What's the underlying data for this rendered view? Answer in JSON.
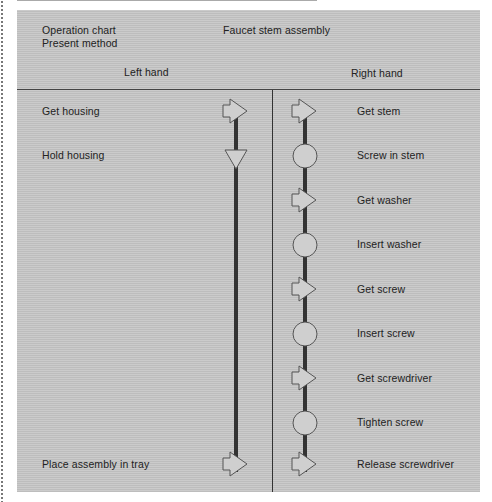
{
  "header": {
    "title_line1": "Operation chart",
    "title_line2": "Present method",
    "subject": "Faucet stem assembly",
    "left_column": "Left hand",
    "right_column": "Right hand"
  },
  "left_hand": [
    {
      "label": "Get housing",
      "symbol": "transport-arrow"
    },
    {
      "label": "Hold housing",
      "symbol": "hold-triangle"
    },
    {
      "label": "Place assembly in tray",
      "symbol": "transport-arrow"
    }
  ],
  "right_hand": [
    {
      "label": "Get stem",
      "symbol": "transport-arrow"
    },
    {
      "label": "Screw in stem",
      "symbol": "operation-circle"
    },
    {
      "label": "Get washer",
      "symbol": "transport-arrow"
    },
    {
      "label": "Insert washer",
      "symbol": "operation-circle"
    },
    {
      "label": "Get screw",
      "symbol": "transport-arrow"
    },
    {
      "label": "Insert screw",
      "symbol": "operation-circle"
    },
    {
      "label": "Get screwdriver",
      "symbol": "transport-arrow"
    },
    {
      "label": "Tighten screw",
      "symbol": "operation-circle"
    },
    {
      "label": "Release screwdriver",
      "symbol": "transport-arrow"
    }
  ],
  "colors": {
    "panel": "#c4c4c4",
    "symbol_fill": "#cfcfcf",
    "symbol_stroke": "#555555",
    "flow_line": "#333333"
  }
}
